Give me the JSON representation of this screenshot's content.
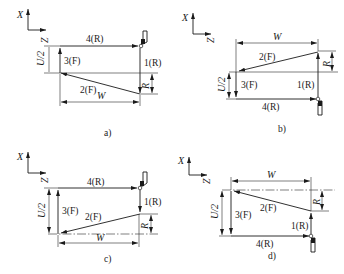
{
  "figure": {
    "panels": [
      {
        "id": "a",
        "caption": "a)",
        "axis_x": "X",
        "axis_z": "Z",
        "moves": [
          "1(R)",
          "2(F)",
          "3(F)",
          "4(R)"
        ],
        "dims": {
          "height": "U/2",
          "width": "W",
          "taper": "R"
        }
      },
      {
        "id": "b",
        "caption": "b)",
        "axis_x": "X",
        "axis_z": "Z",
        "moves": [
          "1(R)",
          "2(F)",
          "3(F)",
          "4(R)"
        ],
        "dims": {
          "height": "U/2",
          "width": "W",
          "taper": "R"
        }
      },
      {
        "id": "c",
        "caption": "c)",
        "axis_x": "X",
        "axis_z": "Z",
        "moves": [
          "1(R)",
          "2(F)",
          "3(F)",
          "4(R)"
        ],
        "dims": {
          "height": "U/2",
          "width": "W",
          "taper": "R"
        }
      },
      {
        "id": "d",
        "caption": "d)",
        "axis_x": "X",
        "axis_z": "Z",
        "moves": [
          "1(R)",
          "2(F)",
          "3(F)",
          "4(R)"
        ],
        "dims": {
          "height": "U/2",
          "width": "W",
          "taper": "R"
        }
      }
    ],
    "colors": {
      "ink": "#1a1a1a",
      "background": "#ffffff"
    }
  }
}
